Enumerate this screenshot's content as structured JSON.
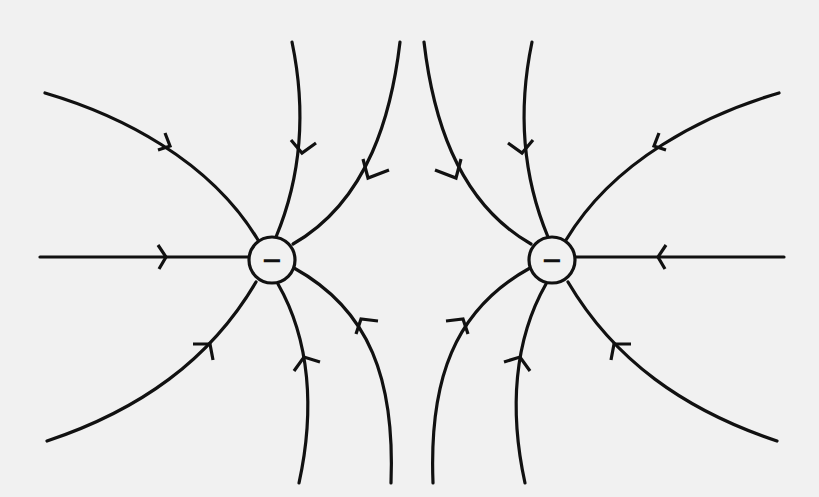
{
  "diagram": {
    "background_color": "#f1f1f1",
    "line_color": "#111111",
    "charges": [
      {
        "id": "left",
        "sign": "−",
        "cx": 272,
        "cy": 260,
        "r": 23
      },
      {
        "id": "right",
        "sign": "−",
        "cx": 552,
        "cy": 260,
        "r": 23
      }
    ],
    "field_line_direction": "inward toward charges"
  }
}
